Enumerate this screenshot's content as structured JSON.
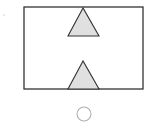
{
  "diagram": {
    "canvas": {
      "width": 154,
      "height": 132,
      "background": "#ffffff"
    },
    "stroke_color": "#333333",
    "fill_color": "#e0e0e0",
    "frame": {
      "x": 24,
      "y": 7,
      "width": 119,
      "height": 82
    },
    "triangles": [
      {
        "name": "upper-triangle",
        "apex": [
          83,
          8
        ],
        "base_left": [
          68,
          36
        ],
        "base_right": [
          99,
          36
        ]
      },
      {
        "name": "lower-triangle",
        "apex": [
          83,
          61
        ],
        "base_left": [
          68,
          89
        ],
        "base_right": [
          99,
          89
        ]
      }
    ],
    "circle": {
      "cx": 84,
      "cy": 114,
      "r": 7,
      "stroke": "#b0b0b0"
    },
    "dot": {
      "cx": 4,
      "cy": 15,
      "r": 0.6
    }
  }
}
